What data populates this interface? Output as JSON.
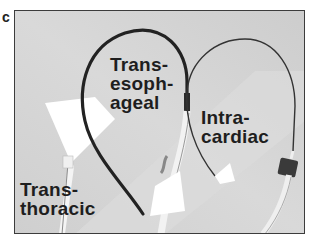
{
  "figure": {
    "panel_letter": "c",
    "background_color": "#d3d3d3",
    "frame_color": "#3c3c3c"
  },
  "labels": {
    "transesophageal": {
      "line1": "Trans-",
      "line2": "esoph-",
      "line3": "ageal"
    },
    "intracardiac": {
      "line1": "Intra-",
      "line2": "cardiac"
    },
    "transthoracic": {
      "line1": "Trans-",
      "line2": "thoracic"
    }
  },
  "probes": [
    {
      "name": "transthoracic-probe",
      "icon": "tte-probe-icon"
    },
    {
      "name": "transesophageal-probe",
      "icon": "tee-probe-icon"
    },
    {
      "name": "intracardiac-catheter",
      "icon": "ice-catheter-icon"
    }
  ]
}
